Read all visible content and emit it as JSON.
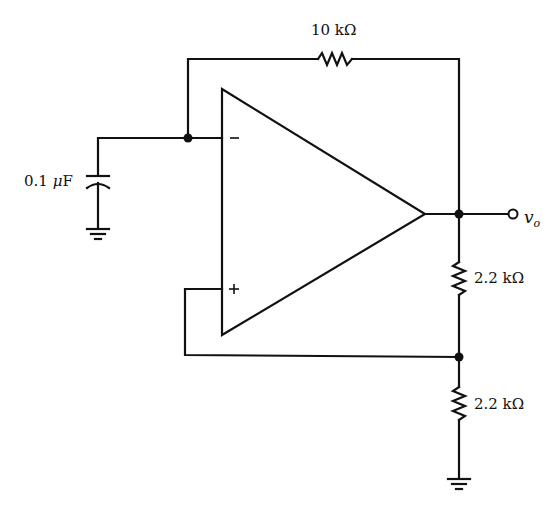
{
  "diagram": {
    "type": "circuit-schematic",
    "components": {
      "feedback_resistor": {
        "label": "10 kΩ"
      },
      "capacitor": {
        "label": "0.1 μF",
        "prefix": "0.1 ",
        "unit_greek": "μ",
        "unit": "F"
      },
      "divider_resistor_top": {
        "label": "2.2 kΩ"
      },
      "divider_resistor_bottom": {
        "label": "2.2 kΩ"
      },
      "opamp": {
        "inverting_label": "−",
        "noninverting_label": "+"
      },
      "output_terminal": {
        "label_main": "v",
        "label_sub": "o"
      }
    },
    "colors": {
      "ink": "#111111",
      "background": "#ffffff"
    }
  }
}
